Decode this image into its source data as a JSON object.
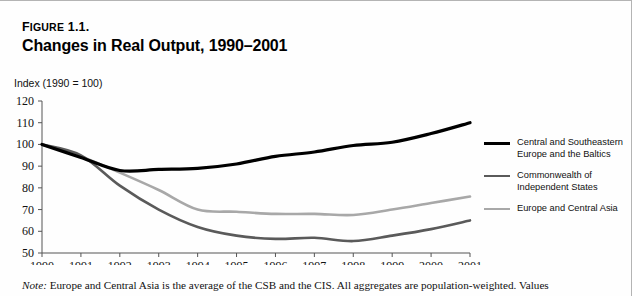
{
  "figure": {
    "label_prefix": "F",
    "label_rest": "IGURE",
    "label_number": " 1.1.",
    "title": "Changes in Real Output, 1990–2001",
    "axis_caption": "Index (1990 = 100)",
    "note_prefix": "Note:",
    "note_body": " Europe and Central Asia is the average of the CSB and the CIS. All aggregates are population-weighted. Values"
  },
  "legend": {
    "entries": [
      {
        "label_line1": "Central and Southeastern",
        "label_line2": "Europe and the Baltics",
        "color": "#000000",
        "thickness": 3.2
      },
      {
        "label_line1": "Commonwealth of",
        "label_line2": "Independent States",
        "color": "#5a5a5a",
        "thickness": 2.6
      },
      {
        "label_line1": "Europe and Central Asia",
        "label_line2": "",
        "color": "#a8a8a8",
        "thickness": 2.6
      }
    ]
  },
  "chart_data": {
    "type": "line",
    "title": "Changes in Real Output, 1990–2001",
    "xlabel": "",
    "ylabel": "Index (1990 = 100)",
    "ylim": [
      50,
      120
    ],
    "yticks": [
      50,
      60,
      70,
      80,
      90,
      100,
      110,
      120
    ],
    "xlim": [
      1990,
      2001
    ],
    "categories": [
      1990,
      1991,
      1992,
      1993,
      1994,
      1995,
      1996,
      1997,
      1998,
      1999,
      2000,
      2001
    ],
    "xticklabels": [
      "1990",
      "1991",
      "1992",
      "1993",
      "1994",
      "1995",
      "1996",
      "1997",
      "1998",
      "1999",
      "2000",
      "2001"
    ],
    "grid": false,
    "legend_position": "right",
    "series": [
      {
        "name": "Central and Southeastern Europe and the Baltics",
        "color": "#000000",
        "width": 3.2,
        "values": [
          100,
          94,
          88,
          88.5,
          89,
          91,
          94.5,
          96.5,
          99.5,
          101,
          105,
          110
        ]
      },
      {
        "name": "Commonwealth of Independent States",
        "color": "#5a5a5a",
        "width": 2.6,
        "values": [
          100,
          95,
          81,
          70,
          62,
          58,
          56.5,
          57,
          55.5,
          58,
          61,
          65
        ]
      },
      {
        "name": "Europe and Central Asia",
        "color": "#a8a8a8",
        "width": 2.6,
        "values": [
          100,
          94.5,
          87,
          79,
          70,
          69,
          68,
          68,
          67.5,
          70,
          73,
          76
        ]
      }
    ]
  }
}
